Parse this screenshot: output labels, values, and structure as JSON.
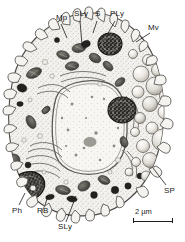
{
  "figure": {
    "type": "micrograph-drawing",
    "background_color": "#ffffff",
    "ink_color": "#1b1b1b"
  },
  "labels": [
    {
      "id": "mp",
      "text": "Mp",
      "x": 56,
      "y": 14,
      "target_x": 68,
      "target_y": 38
    },
    {
      "id": "sly-top",
      "text": "SLy",
      "x": 74,
      "y": 10,
      "target_x": 82,
      "target_y": 44
    },
    {
      "id": "s",
      "text": "S",
      "x": 95,
      "y": 10,
      "target_x": 92,
      "target_y": 32
    },
    {
      "id": "ply",
      "text": "PLy",
      "x": 110,
      "y": 10,
      "target_x": 105,
      "target_y": 36
    },
    {
      "id": "mv",
      "text": "Mv",
      "x": 148,
      "y": 24,
      "target_x": 134,
      "target_y": 40
    },
    {
      "id": "sp",
      "text": "SP",
      "x": 164,
      "y": 187,
      "target_x": 152,
      "target_y": 168
    },
    {
      "id": "ph",
      "text": "Ph",
      "x": 12,
      "y": 207,
      "target_x": 24,
      "target_y": 192
    },
    {
      "id": "rb",
      "text": "RB",
      "x": 37,
      "y": 207,
      "target_x": 45,
      "target_y": 196
    },
    {
      "id": "sly-bottom",
      "text": "SLy",
      "x": 58,
      "y": 223,
      "target_x": 75,
      "target_y": 196
    }
  ],
  "scale_bar": {
    "text": "2 µm",
    "text_x": 135,
    "text_y": 209,
    "bar_x": 133,
    "bar_y": 221,
    "bar_length": 40
  },
  "structures": {
    "nucleus": "nucleus",
    "cytoplasm": "cytoplasm",
    "microvilli": "microvilli",
    "spores": "spore-cluster",
    "phagosome": "phagosome",
    "mitochondria": "mitochondria"
  }
}
